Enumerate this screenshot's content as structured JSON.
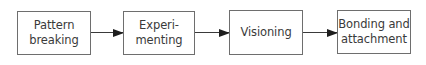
{
  "diagram": {
    "type": "flowchart",
    "direction": "left-to-right",
    "nodes": [
      {
        "id": "pattern-breaking",
        "label": "Pattern\nbreaking"
      },
      {
        "id": "experimenting",
        "label": "Experi-\nmenting"
      },
      {
        "id": "visioning",
        "label": "Visioning"
      },
      {
        "id": "bonding-and-attachment",
        "label": "Bonding and\nattachment"
      }
    ],
    "edges": [
      {
        "from": "pattern-breaking",
        "to": "experimenting"
      },
      {
        "from": "experimenting",
        "to": "visioning"
      },
      {
        "from": "visioning",
        "to": "bonding-and-attachment"
      }
    ],
    "colors": {
      "box_border": "#6e6e6e",
      "text": "#3a3a3a",
      "arrow": "#1e1e1e",
      "background": "#ffffff"
    }
  }
}
